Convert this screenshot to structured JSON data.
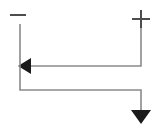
{
  "figure": {
    "title": "Current flow between negative and positive terminals",
    "width": 162,
    "height": 133,
    "background_color": "#ffffff"
  },
  "style": {
    "wire_color": "#8a8a8a",
    "wire_width": 1.6,
    "terminal_color": "#4d4d4d",
    "terminal_width": 2.0,
    "arrowhead_color": "#1a1a1a"
  },
  "terminals": [
    {
      "id": "negative-terminal",
      "symbol": "minus",
      "label": "−",
      "x": 20,
      "y": 15,
      "mark": {
        "x1": 10,
        "y1": 15,
        "x2": 26,
        "y2": 15
      }
    },
    {
      "id": "positive-terminal",
      "symbol": "plus",
      "label": "+",
      "x": 141,
      "y": 19,
      "mark": {
        "h_x1": 132,
        "h_y1": 19,
        "h_x2": 150,
        "h_y2": 19,
        "v_x1": 141,
        "v_y1": 10,
        "v_x2": 141,
        "v_y2": 28
      }
    }
  ],
  "paths": [
    {
      "id": "upper-path",
      "description": "From positive terminal down then left to arrowhead",
      "points": "141,28 141,66 31,66",
      "arrow": {
        "id": "left-arrowhead",
        "direction": "left",
        "tip_x": 18,
        "tip_y": 66,
        "points": "18,66 31,58 31,74"
      }
    },
    {
      "id": "lower-path",
      "description": "From negative terminal down, right, then down to arrowhead",
      "points": "20,24 20,90 141,90 141,111",
      "arrow": {
        "id": "down-arrowhead",
        "direction": "down",
        "tip_x": 141,
        "tip_y": 124,
        "points": "141,124 131,110 151,110"
      }
    }
  ]
}
